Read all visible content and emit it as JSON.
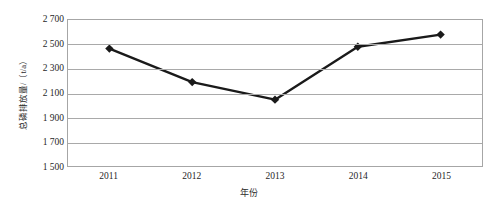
{
  "chart_data": {
    "type": "line",
    "title": "",
    "xlabel": "年份",
    "ylabel": "总磷排放量/（t/a）",
    "categories": [
      "2011",
      "2012",
      "2013",
      "2014",
      "2015"
    ],
    "values": [
      2465,
      2190,
      2045,
      2480,
      2580
    ],
    "series": [
      {
        "name": "总磷排放量",
        "values": [
          2465,
          2190,
          2045,
          2480,
          2580
        ]
      }
    ],
    "ylim": [
      1500,
      2700
    ],
    "ytick_labels": [
      "2 700",
      "2 500",
      "2 300",
      "2 100",
      "1 900",
      "1 700",
      "1 500"
    ],
    "ytick_values": [
      2700,
      2500,
      2300,
      2100,
      1900,
      1700,
      1500
    ],
    "grid": true,
    "legend": "none",
    "line_color": "#1a1a1a",
    "marker": "diamond",
    "marker_color": "#1a1a1a",
    "plot_border_color": "#a6a6a6",
    "gridline_color": "#a9a9a9"
  }
}
